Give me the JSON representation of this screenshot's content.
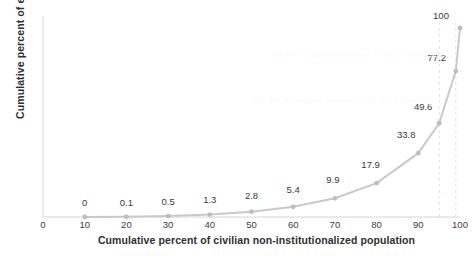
{
  "chart_data": {
    "type": "line",
    "title": "",
    "xlabel": "Cumulative percent of civilian non-institutionalized population",
    "ylabel": "Cumulative percent of expenditures",
    "xlim": [
      0,
      100
    ],
    "ylim": [
      0,
      100
    ],
    "grid": false,
    "legend": false,
    "x": [
      10,
      20,
      30,
      40,
      50,
      60,
      70,
      80,
      90,
      95,
      99,
      100
    ],
    "values": [
      0,
      0.1,
      0.5,
      1.3,
      2.8,
      5.4,
      9.9,
      17.9,
      33.8,
      49.6,
      77.2,
      100
    ],
    "point_labels": [
      "0",
      "0.1",
      "0.5",
      "1.3",
      "2.8",
      "5.4",
      "9.9",
      "17.9",
      "33.8",
      "49.6",
      "77.2",
      "100"
    ],
    "xticks": [
      "0",
      "10",
      "20",
      "30",
      "40",
      "50",
      "60",
      "70",
      "80",
      "90",
      "100"
    ],
    "xtick_values": [
      0,
      10,
      20,
      30,
      40,
      50,
      60,
      70,
      80,
      90,
      100
    ],
    "yticks": [],
    "series_color": "#c9c9c9",
    "marker_color": "#bdbdbd",
    "reference_lines": [
      {
        "x": 95,
        "label": "95",
        "style": "dashed",
        "color": "#e2e2e2"
      },
      {
        "x": 99,
        "label": "99",
        "style": "dashed",
        "color": "#e2e2e2"
      }
    ],
    "annotations": [
      {
        "text": "Top 1% of spenders account for 22.8% of spending",
        "x": 76,
        "y": 86
      },
      {
        "text": "Top 5% of spenders account for 50.4% of spending",
        "x": 72,
        "y": 62
      }
    ]
  },
  "axis": {
    "line_color": "#d6d6d6"
  }
}
